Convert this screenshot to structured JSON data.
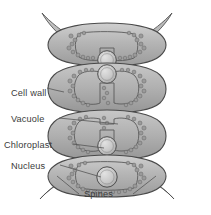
{
  "figure": {
    "kind": "biological-cell-diagram",
    "background_color": "#ffffff",
    "line_color": "#4a4a4a",
    "cytoplasm_fill": "#b9b9b9",
    "vacuole_fill": "#ffffff",
    "nucleus_fill": "#c9c9c9",
    "chloroplast_fill": "#9a9a9a",
    "text_color": "#3b3b3b"
  },
  "labels": {
    "cell_wall": "Cell wall",
    "vacuole": "Vacuole",
    "chloroplast": "Chloroplast",
    "nucleus": "Nucleus",
    "spines": "Spines"
  },
  "cells": [
    {
      "index": 1,
      "has_nucleus": true,
      "has_vacuole": true,
      "has_chloroplast": true,
      "spines": 2
    },
    {
      "index": 2,
      "has_nucleus": true,
      "has_vacuole": true,
      "has_chloroplast": true,
      "spines": 0
    },
    {
      "index": 3,
      "has_nucleus": true,
      "has_vacuole": true,
      "has_chloroplast": true,
      "spines": 0
    },
    {
      "index": 4,
      "has_nucleus": true,
      "has_vacuole": true,
      "has_chloroplast": true,
      "spines": 2
    }
  ],
  "counts": {
    "cells": "4",
    "spines": "4"
  }
}
